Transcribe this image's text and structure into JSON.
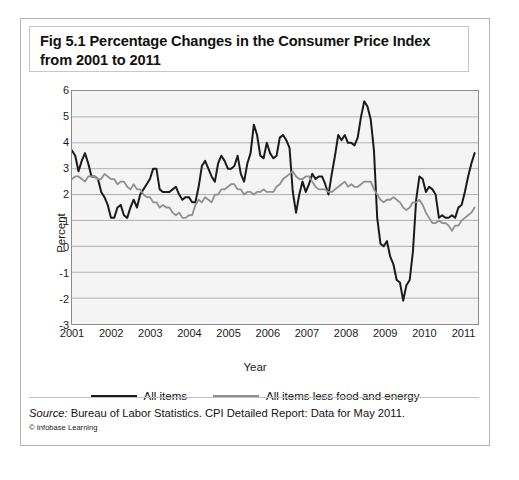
{
  "figure": {
    "title": "Fig 5.1 Percentage Changes in the Consumer Price Index from 2001 to 2011",
    "source_prefix": "Source:",
    "source_text": " Bureau of Labor Statistics. CPI Detailed Report: Data for May 2011.",
    "credit": "© Infobase Learning"
  },
  "chart_data": {
    "type": "line",
    "title": "Fig 5.1 Percentage Changes in the Consumer Price Index from 2001 to 2011",
    "xlabel": "Year",
    "ylabel": "Percent",
    "xlim": [
      2001.0,
      2011.42
    ],
    "ylim": [
      -3,
      6
    ],
    "yticks": [
      6,
      5,
      4,
      3,
      2,
      1,
      0,
      -1,
      -2,
      -3
    ],
    "xticks": [
      2001,
      2002,
      2003,
      2004,
      2005,
      2006,
      2007,
      2008,
      2009,
      2010,
      2011
    ],
    "grid": "horizontal",
    "legend_position": "below",
    "colors": {
      "all_items": "#1a1a1a",
      "core": "#8f8f8f"
    },
    "x": [
      2001.0,
      2001.083,
      2001.167,
      2001.25,
      2001.333,
      2001.417,
      2001.5,
      2001.583,
      2001.667,
      2001.75,
      2001.833,
      2001.917,
      2002.0,
      2002.083,
      2002.167,
      2002.25,
      2002.333,
      2002.417,
      2002.5,
      2002.583,
      2002.667,
      2002.75,
      2002.833,
      2002.917,
      2003.0,
      2003.083,
      2003.167,
      2003.25,
      2003.333,
      2003.417,
      2003.5,
      2003.583,
      2003.667,
      2003.75,
      2003.833,
      2003.917,
      2004.0,
      2004.083,
      2004.167,
      2004.25,
      2004.333,
      2004.417,
      2004.5,
      2004.583,
      2004.667,
      2004.75,
      2004.833,
      2004.917,
      2005.0,
      2005.083,
      2005.167,
      2005.25,
      2005.333,
      2005.417,
      2005.5,
      2005.583,
      2005.667,
      2005.75,
      2005.833,
      2005.917,
      2006.0,
      2006.083,
      2006.167,
      2006.25,
      2006.333,
      2006.417,
      2006.5,
      2006.583,
      2006.667,
      2006.75,
      2006.833,
      2006.917,
      2007.0,
      2007.083,
      2007.167,
      2007.25,
      2007.333,
      2007.417,
      2007.5,
      2007.583,
      2007.667,
      2007.75,
      2007.833,
      2007.917,
      2008.0,
      2008.083,
      2008.167,
      2008.25,
      2008.333,
      2008.417,
      2008.5,
      2008.583,
      2008.667,
      2008.75,
      2008.833,
      2008.917,
      2009.0,
      2009.083,
      2009.167,
      2009.25,
      2009.333,
      2009.417,
      2009.5,
      2009.583,
      2009.667,
      2009.75,
      2009.833,
      2009.917,
      2010.0,
      2010.083,
      2010.167,
      2010.25,
      2010.333,
      2010.417,
      2010.5,
      2010.583,
      2010.667,
      2010.75,
      2010.833,
      2010.917,
      2011.0,
      2011.083,
      2011.167,
      2011.25,
      2011.333
    ],
    "series": [
      {
        "name": "All items",
        "color": "#1a1a1a",
        "values": [
          3.7,
          3.5,
          2.9,
          3.3,
          3.6,
          3.2,
          2.7,
          2.7,
          2.6,
          2.1,
          1.9,
          1.6,
          1.1,
          1.1,
          1.5,
          1.6,
          1.2,
          1.1,
          1.5,
          1.8,
          1.5,
          2.0,
          2.2,
          2.4,
          2.6,
          3.0,
          3.0,
          2.2,
          2.1,
          2.1,
          2.1,
          2.2,
          2.3,
          2.0,
          1.8,
          1.9,
          1.9,
          1.7,
          1.7,
          2.3,
          3.1,
          3.3,
          3.0,
          2.7,
          2.5,
          3.2,
          3.5,
          3.3,
          3.0,
          3.0,
          3.1,
          3.5,
          2.8,
          2.5,
          3.2,
          3.6,
          4.7,
          4.3,
          3.5,
          3.4,
          4.0,
          3.6,
          3.4,
          3.5,
          4.2,
          4.3,
          4.1,
          3.8,
          2.1,
          1.3,
          2.0,
          2.5,
          2.1,
          2.4,
          2.8,
          2.6,
          2.7,
          2.7,
          2.4,
          2.0,
          2.8,
          3.5,
          4.3,
          4.1,
          4.3,
          4.0,
          4.0,
          3.9,
          4.2,
          5.0,
          5.6,
          5.4,
          4.9,
          3.7,
          1.1,
          0.1,
          0.0,
          0.2,
          -0.4,
          -0.7,
          -1.3,
          -1.4,
          -2.1,
          -1.5,
          -1.3,
          -0.2,
          1.8,
          2.7,
          2.6,
          2.1,
          2.3,
          2.2,
          2.0,
          1.1,
          1.2,
          1.1,
          1.1,
          1.2,
          1.1,
          1.5,
          1.6,
          2.1,
          2.7,
          3.2,
          3.6
        ]
      },
      {
        "name": "All items less food and energy",
        "color": "#8f8f8f",
        "values": [
          2.6,
          2.7,
          2.7,
          2.6,
          2.5,
          2.7,
          2.7,
          2.7,
          2.6,
          2.6,
          2.8,
          2.7,
          2.6,
          2.6,
          2.4,
          2.5,
          2.5,
          2.3,
          2.2,
          2.4,
          2.2,
          2.2,
          2.0,
          1.9,
          1.9,
          1.7,
          1.7,
          1.5,
          1.6,
          1.5,
          1.5,
          1.3,
          1.2,
          1.3,
          1.1,
          1.1,
          1.2,
          1.2,
          1.6,
          1.8,
          1.7,
          1.9,
          1.8,
          1.7,
          2.0,
          2.0,
          2.2,
          2.2,
          2.3,
          2.4,
          2.4,
          2.2,
          2.2,
          2.0,
          2.1,
          2.1,
          2.0,
          2.1,
          2.1,
          2.2,
          2.1,
          2.1,
          2.1,
          2.3,
          2.4,
          2.6,
          2.7,
          2.8,
          2.9,
          2.7,
          2.6,
          2.6,
          2.7,
          2.7,
          2.5,
          2.3,
          2.2,
          2.2,
          2.2,
          2.1,
          2.1,
          2.2,
          2.3,
          2.4,
          2.5,
          2.3,
          2.4,
          2.3,
          2.3,
          2.4,
          2.5,
          2.5,
          2.5,
          2.2,
          2.0,
          1.8,
          1.7,
          1.8,
          1.8,
          1.9,
          1.8,
          1.7,
          1.5,
          1.4,
          1.5,
          1.7,
          1.7,
          1.8,
          1.6,
          1.3,
          1.1,
          0.9,
          0.9,
          1.0,
          0.9,
          0.9,
          0.8,
          0.6,
          0.8,
          0.8,
          1.0,
          1.1,
          1.2,
          1.3,
          1.5
        ]
      }
    ]
  }
}
